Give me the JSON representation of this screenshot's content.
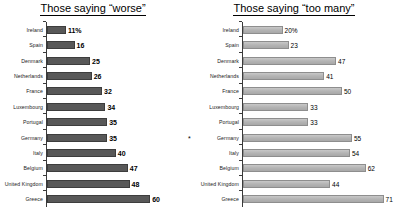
{
  "chart_data": [
    {
      "type": "bar",
      "title": "Those saying “worse”",
      "orientation": "horizontal",
      "xlabel": "",
      "ylabel": "",
      "xlim": [
        0,
        75
      ],
      "grid": false,
      "legend": null,
      "categories": [
        "Ireland",
        "Spain",
        "Denmark",
        "Netherlands",
        "France",
        "Luxembourg",
        "Portugal",
        "Germany",
        "Italy",
        "Belgium",
        "United Kingdom",
        "Greece"
      ],
      "values": [
        11,
        16,
        25,
        26,
        32,
        34,
        35,
        35,
        40,
        47,
        48,
        60
      ],
      "value_labels": [
        "11%",
        "16",
        "25",
        "26",
        "32",
        "34",
        "35",
        "35",
        "40",
        "47",
        "48",
        "60"
      ],
      "markers": [
        "",
        "",
        "",
        "",
        "",
        "",
        "",
        "",
        "",
        "",
        "",
        ""
      ],
      "bar_color": "#585858",
      "bar_border_color": "#3d3d3d"
    },
    {
      "type": "bar",
      "title": "Those saying “too many”",
      "orientation": "horizontal",
      "xlabel": "",
      "ylabel": "",
      "xlim": [
        0,
        75
      ],
      "grid": false,
      "legend": null,
      "categories": [
        "Ireland",
        "Spain",
        "Denmark",
        "Netherlands",
        "France",
        "Luxembourg",
        "Portugal",
        "Germany",
        "Italy",
        "Belgium",
        "United Kingdom",
        "Greece"
      ],
      "values": [
        20,
        23,
        47,
        41,
        50,
        33,
        33,
        55,
        54,
        62,
        44,
        71
      ],
      "value_labels": [
        "20%",
        "23",
        "47",
        "41",
        "50",
        "33",
        "33",
        "55",
        "54",
        "62",
        "44",
        "71"
      ],
      "markers": [
        "",
        "",
        "",
        "",
        "",
        "",
        "",
        "*",
        "",
        "",
        "",
        ""
      ],
      "bar_color": "#b4b4b4",
      "bar_border_color": "#8e8e8e"
    }
  ]
}
